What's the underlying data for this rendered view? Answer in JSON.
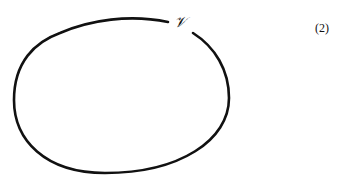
{
  "diagram": {
    "curve_label": "𝒱",
    "equation_number": "(2)",
    "stroke_color": "#111111",
    "shape": "closed curve (oval) with a small gap near top-right where the label sits"
  }
}
